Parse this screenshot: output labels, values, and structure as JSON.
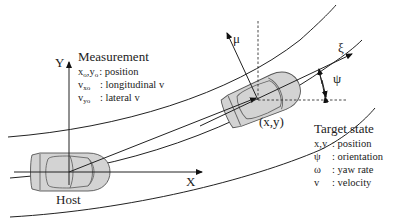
{
  "diagram": {
    "host_label": "Host",
    "axis_x_label": "X",
    "axis_y_label": "Y",
    "target_axis_xi_label": "ξ",
    "target_axis_mu_label": "μ",
    "target_position_label": "(x,y)",
    "orientation_angle_label": "ψ",
    "measurement": {
      "title": "Measurement",
      "items": [
        {
          "symbol": "xo,yo",
          "symbol_main_1": "x",
          "symbol_sub_1": "o",
          "symbol_sep": ",",
          "symbol_main_2": "y",
          "symbol_sub_2": "o",
          "description": ": position"
        },
        {
          "symbol_main": "v",
          "symbol_sub": "xo",
          "description": ": longitudinal v"
        },
        {
          "symbol_main": "v",
          "symbol_sub": "yo",
          "description": ": lateral v"
        }
      ]
    },
    "target_state": {
      "title": "Target state",
      "items": [
        {
          "symbol": "x,y",
          "description": ": position"
        },
        {
          "symbol": "ψ",
          "description": ": orientation"
        },
        {
          "symbol": "ω",
          "description": ": yaw rate"
        },
        {
          "symbol": "v",
          "description": ": velocity"
        }
      ]
    },
    "colors": {
      "line": "#222222",
      "car_fill": "#d3d3d3",
      "car_outline": "#555555"
    }
  }
}
